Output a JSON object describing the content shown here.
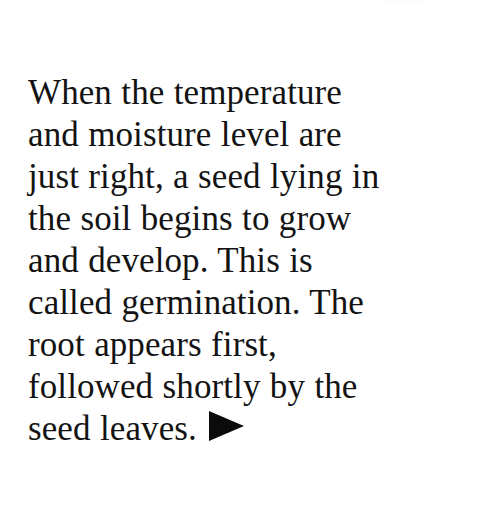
{
  "page": {
    "background_color": "#ffffff",
    "text_color": "#131313",
    "width": 480,
    "height": 508
  },
  "passage": {
    "full_text": "When the temperature and moisture level are just right, a seed lying in the soil begins to grow and develop. This is called germination. The root appears first, followed shortly by the seed leaves.",
    "lines": [
      "When the temperature",
      "and moisture level are",
      "just right, a seed lying in",
      "the soil begins to grow",
      "and develop. This is",
      "called germination. The",
      "root appears first,",
      "followed shortly by the",
      "seed leaves."
    ],
    "end_marker": {
      "glyph": "▶",
      "name": "right-pointing-triangle",
      "color": "#0b0b0b"
    }
  }
}
